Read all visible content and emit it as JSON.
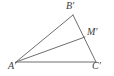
{
  "figure": {
    "kind": "geometry-diagram",
    "background_color": "#ffffff",
    "stroke_color": "#6e6e6e",
    "label_color": "#3b3b3b",
    "stroke_width": 1,
    "width": 114,
    "height": 76
  },
  "points": {
    "A": {
      "label": "A′",
      "x": 16,
      "y": 62
    },
    "B": {
      "label": "B′",
      "x": 73,
      "y": 15
    },
    "C": {
      "label": "C′",
      "x": 96,
      "y": 62
    },
    "M": {
      "label": "M′",
      "x": 85,
      "y": 37
    }
  },
  "segments": [
    {
      "name": "side-AB",
      "from": "A",
      "to": "B"
    },
    {
      "name": "side-BC",
      "from": "B",
      "to": "C"
    },
    {
      "name": "side-AC",
      "from": "A",
      "to": "C"
    },
    {
      "name": "cevian-AM",
      "from": "A",
      "to": "M"
    }
  ],
  "labels": {
    "A": "A′",
    "B": "B′",
    "C": "C′",
    "M": "M′"
  }
}
